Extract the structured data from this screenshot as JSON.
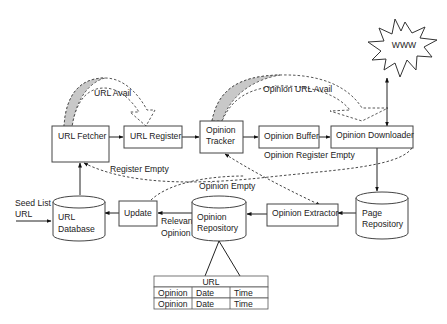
{
  "diagram": {
    "type": "architecture-flow",
    "nodes": {
      "www": {
        "label": "WWW",
        "shape": "starburst"
      },
      "url_fetcher": {
        "label": "URL Fetcher",
        "shape": "box"
      },
      "url_register": {
        "label": "URL Register",
        "shape": "box"
      },
      "opinion_tracker": {
        "line1": "Opinion",
        "line2": "Tracker",
        "shape": "box"
      },
      "opinion_buffer": {
        "label": "Opinion Buffer",
        "shape": "box"
      },
      "opinion_downloader": {
        "label": "Opinion Downloader",
        "shape": "box"
      },
      "url_database": {
        "line1": "URL",
        "line2": "Database",
        "shape": "cylinder"
      },
      "update": {
        "label": "Update",
        "shape": "box"
      },
      "opinion_repository": {
        "line1": "Opinion",
        "line2": "Repository",
        "shape": "cylinder"
      },
      "opinion_extractor": {
        "label": "Opinion Extractor",
        "shape": "box"
      },
      "page_repository": {
        "line1": "Page",
        "line2": "Repository",
        "shape": "cylinder"
      }
    },
    "edge_labels": {
      "url_avail": "URL Avail",
      "opinion_url_avail": "Opinion URL Avail",
      "register_empty": "Register Empty",
      "opinion_register_empty": "Opinion Register Empty",
      "opinion_empty": "Opinion Empty",
      "relevant_opinion_1": "Relevant",
      "relevant_opinion_2": "Opinion",
      "seed_list_1": "Seed List",
      "seed_list_2": "URL"
    },
    "edges": [
      {
        "from": "URL Fetcher",
        "to": "URL Register",
        "style": "solid"
      },
      {
        "from": "URL Register",
        "to": "Opinion Tracker",
        "style": "solid"
      },
      {
        "from": "Opinion Tracker",
        "to": "Opinion Buffer",
        "style": "solid"
      },
      {
        "from": "Opinion Buffer",
        "to": "Opinion Downloader",
        "style": "solid"
      },
      {
        "from": "Opinion Downloader",
        "to": "WWW",
        "style": "solid-bidirectional"
      },
      {
        "from": "Opinion Downloader",
        "to": "Page Repository",
        "style": "solid"
      },
      {
        "from": "Page Repository",
        "to": "Opinion Extractor",
        "style": "solid"
      },
      {
        "from": "Opinion Extractor",
        "to": "Opinion Repository",
        "style": "solid"
      },
      {
        "from": "Opinion Repository",
        "to": "Update",
        "style": "solid",
        "label": "Relevant Opinion"
      },
      {
        "from": "Update",
        "to": "URL Database",
        "style": "solid"
      },
      {
        "from": "URL Database",
        "to": "URL Fetcher",
        "style": "solid"
      },
      {
        "from": "Seed List URL",
        "to": "URL Database",
        "style": "solid"
      },
      {
        "from": "URL Fetcher",
        "to": "URL Register",
        "style": "curved-block-arrow",
        "label": "URL Avail"
      },
      {
        "from": "Opinion Tracker",
        "to": "Opinion Downloader",
        "style": "curved-block-arrow",
        "label": "Opinion URL Avail"
      },
      {
        "from": "Opinion Downloader",
        "to": "URL Fetcher",
        "style": "dashed",
        "label": "Register Empty / Opinion Register Empty"
      },
      {
        "from": "Opinion Tracker",
        "to": "Opinion Extractor",
        "style": "dashed-bidirectional"
      },
      {
        "from": "Update",
        "to": "Opinion Extractor",
        "style": "dashed",
        "label": "Opinion Empty"
      }
    ],
    "table": {
      "header": "URL",
      "rows": [
        [
          "Opinion",
          "Date",
          "Time"
        ],
        [
          "Opinion",
          "Date",
          "Time"
        ]
      ]
    }
  }
}
